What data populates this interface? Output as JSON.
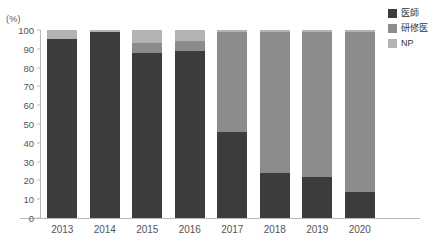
{
  "chart_data": {
    "type": "bar",
    "stacked": true,
    "stack_mode": "percent",
    "title": "",
    "xlabel": "",
    "ylabel": "(%)",
    "ylim": [
      0,
      100
    ],
    "ytick_step": 10,
    "grid": false,
    "legend_position": "right-top",
    "categories": [
      "2013",
      "2014",
      "2015",
      "2016",
      "2017",
      "2018",
      "2019",
      "2020"
    ],
    "yticks": [
      "100",
      "90",
      "80",
      "70",
      "60",
      "50",
      "40",
      "30",
      "20",
      "10",
      "0"
    ],
    "series": [
      {
        "name": "医師",
        "color": "#3c3c3c",
        "values": [
          95,
          99,
          88,
          89,
          46,
          24,
          22,
          14
        ]
      },
      {
        "name": "研修医",
        "color": "#8c8c8c",
        "values": [
          0,
          0,
          5,
          5,
          53,
          75,
          77,
          85
        ]
      },
      {
        "name": "NP",
        "color": "#b3b3b3",
        "values": [
          5,
          1,
          7,
          6,
          1,
          1,
          1,
          1
        ]
      }
    ]
  },
  "axis": {
    "unit_label": "(%)"
  },
  "legend": {
    "items": [
      {
        "label": "医師",
        "color": "#3c3c3c"
      },
      {
        "label": "研修医",
        "color": "#8c8c8c"
      },
      {
        "label": "NP",
        "color": "#b3b3b3"
      }
    ]
  }
}
